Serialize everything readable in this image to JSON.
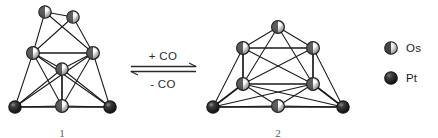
{
  "figure": {
    "kind": "chemical-reaction-scheme"
  },
  "reaction": {
    "forward_label": "+ CO",
    "reverse_label": "- CO",
    "arrow_type": "equilibrium"
  },
  "legend": {
    "items": [
      {
        "symbol": "os-sphere-icon",
        "label": "Os",
        "style": "light",
        "color": "#e8e8e8",
        "stroke": "#1a1a1a"
      },
      {
        "symbol": "pt-sphere-icon",
        "label": "Pt",
        "style": "dark",
        "color": "#1c1c1c",
        "stroke": "#1a1a1a"
      }
    ]
  },
  "clusters": [
    {
      "id": "cluster-left",
      "caption": "1",
      "atom_counts": {
        "Os": 6,
        "Pt": 3,
        "total": 9
      },
      "atoms": [
        {
          "id": "L1",
          "element": "Os",
          "x": 45,
          "y": 12,
          "r": 6.2
        },
        {
          "id": "L2",
          "element": "Os",
          "x": 73,
          "y": 17,
          "r": 6.2
        },
        {
          "id": "L3",
          "element": "Os",
          "x": 33,
          "y": 53,
          "r": 6.4
        },
        {
          "id": "L4",
          "element": "Os",
          "x": 93,
          "y": 53,
          "r": 6.4
        },
        {
          "id": "L5",
          "element": "Os",
          "x": 62,
          "y": 69,
          "r": 6.2
        },
        {
          "id": "L6",
          "element": "Os",
          "x": 62,
          "y": 106,
          "r": 6.4
        },
        {
          "id": "L7",
          "element": "Pt",
          "x": 15,
          "y": 107,
          "r": 6.2
        },
        {
          "id": "L8",
          "element": "Pt",
          "x": 110,
          "y": 107,
          "r": 6.2
        }
      ],
      "bonds": [
        [
          "L1",
          "L2"
        ],
        [
          "L1",
          "L3"
        ],
        [
          "L1",
          "L4"
        ],
        [
          "L2",
          "L3"
        ],
        [
          "L2",
          "L4"
        ],
        [
          "L3",
          "L4"
        ],
        [
          "L3",
          "L5"
        ],
        [
          "L4",
          "L5"
        ],
        [
          "L5",
          "L6"
        ],
        [
          "L3",
          "L6"
        ],
        [
          "L4",
          "L6"
        ],
        [
          "L3",
          "L7"
        ],
        [
          "L4",
          "L8"
        ],
        [
          "L3",
          "L8"
        ],
        [
          "L4",
          "L7"
        ],
        [
          "L5",
          "L7"
        ],
        [
          "L5",
          "L8"
        ],
        [
          "L7",
          "L6"
        ],
        [
          "L8",
          "L6"
        ],
        [
          "L7",
          "L8"
        ]
      ]
    },
    {
      "id": "cluster-right",
      "caption": "2",
      "atom_counts": {
        "Os": 7,
        "Pt": 3,
        "total": 10
      },
      "atoms": [
        {
          "id": "R1",
          "element": "Os",
          "x": 278,
          "y": 27,
          "r": 6.4
        },
        {
          "id": "R2",
          "element": "Os",
          "x": 243,
          "y": 48,
          "r": 6.4
        },
        {
          "id": "R3",
          "element": "Os",
          "x": 313,
          "y": 48,
          "r": 6.4
        },
        {
          "id": "R4",
          "element": "Os",
          "x": 243,
          "y": 84,
          "r": 6.4
        },
        {
          "id": "R5",
          "element": "Os",
          "x": 313,
          "y": 84,
          "r": 6.4
        },
        {
          "id": "R6",
          "element": "Os",
          "x": 278,
          "y": 106,
          "r": 6.4
        },
        {
          "id": "R7",
          "element": "Pt",
          "x": 213,
          "y": 107,
          "r": 6.2
        },
        {
          "id": "R8",
          "element": "Pt",
          "x": 343,
          "y": 107,
          "r": 6.2
        }
      ],
      "bonds": [
        [
          "R1",
          "R2"
        ],
        [
          "R1",
          "R3"
        ],
        [
          "R2",
          "R3"
        ],
        [
          "R1",
          "R4"
        ],
        [
          "R1",
          "R5"
        ],
        [
          "R2",
          "R5"
        ],
        [
          "R3",
          "R4"
        ],
        [
          "R2",
          "R4"
        ],
        [
          "R3",
          "R5"
        ],
        [
          "R4",
          "R5"
        ],
        [
          "R4",
          "R6"
        ],
        [
          "R5",
          "R6"
        ],
        [
          "R4",
          "R7"
        ],
        [
          "R5",
          "R8"
        ],
        [
          "R2",
          "R7"
        ],
        [
          "R3",
          "R8"
        ],
        [
          "R7",
          "R6"
        ],
        [
          "R8",
          "R6"
        ],
        [
          "R7",
          "R8"
        ],
        [
          "R4",
          "R8"
        ],
        [
          "R5",
          "R7"
        ]
      ]
    }
  ]
}
